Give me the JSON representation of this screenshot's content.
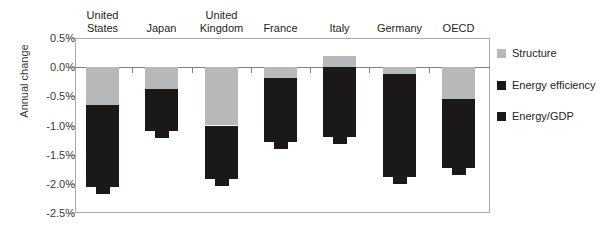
{
  "chart_data": {
    "type": "bar",
    "title": "",
    "subtitle": "",
    "xlabel": "",
    "ylabel": "Annual change",
    "stacked": true,
    "grid": false,
    "legend_position": "right",
    "ylim": [
      -2.5,
      0.5
    ],
    "ytick_labels": [
      "0.5%",
      "0.0%",
      "-0.5%",
      "-1.0%",
      "-1.5%",
      "-2.0%",
      "-2.5%"
    ],
    "ytick_values": [
      0.5,
      0.0,
      -0.5,
      -1.0,
      -1.5,
      -2.0,
      -2.5
    ],
    "categories": [
      "United States",
      "Japan",
      "United Kingdom",
      "France",
      "Italy",
      "Germany",
      "OECD"
    ],
    "series": [
      {
        "name": "Structure",
        "color": "#b7b8ba",
        "values": [
          -0.65,
          -0.38,
          -1.0,
          -0.18,
          0.19,
          -0.12,
          -0.55
        ]
      },
      {
        "name": "Energy efficiency",
        "color": "#1b181a",
        "values": [
          -1.4,
          -0.72,
          -0.92,
          -1.1,
          -1.39,
          -1.76,
          -1.18
        ]
      }
    ],
    "totals": {
      "name": "Energy/GDP",
      "color": "#1b181a",
      "values": [
        -2.05,
        -1.1,
        -1.92,
        -1.28,
        -1.2,
        -1.88,
        -1.73
      ]
    },
    "legend": [
      {
        "label": "Structure",
        "color": "#b7b8ba"
      },
      {
        "label": "Energy efficiency",
        "color": "#1b181a"
      },
      {
        "label": "Energy/GDP",
        "color": "#1b181a"
      }
    ],
    "axis_color": "#a7a9ac",
    "zero_line_color": "#808285"
  }
}
